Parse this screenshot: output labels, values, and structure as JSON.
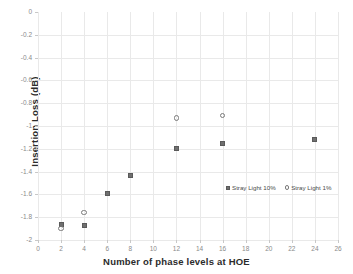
{
  "chart_data": {
    "type": "scatter",
    "title": "",
    "xlabel": "Number of phase levels at HOE",
    "ylabel": "Insertion Loss (dB)",
    "xlim": [
      0,
      26
    ],
    "ylim": [
      -2,
      0
    ],
    "xticks": [
      0,
      2,
      4,
      6,
      8,
      10,
      12,
      14,
      16,
      18,
      20,
      22,
      24,
      26
    ],
    "xtick_labels": [
      "0",
      "2",
      "4",
      "6",
      "8",
      "10",
      "12",
      "14",
      "16",
      "18",
      "20",
      "22",
      "24",
      "26"
    ],
    "yticks": [
      0,
      -0.2,
      -0.4,
      -0.6,
      -0.8,
      -1,
      -1.2,
      -1.4,
      -1.6,
      -1.8,
      -2
    ],
    "ytick_labels": [
      "0",
      "-0.2",
      "-0.4",
      "-0.6",
      "-0.8",
      "-1",
      "-1.2",
      "-1.4",
      "-1.6",
      "-1.8",
      "-2"
    ],
    "grid": true,
    "legend_position": "inside-lower-right",
    "series": [
      {
        "name": "Stray Light 10%",
        "marker": "filled-square",
        "color": "#6f6f6f",
        "points": [
          {
            "x": 2,
            "y": -1.86
          },
          {
            "x": 4,
            "y": -1.87
          },
          {
            "x": 6,
            "y": -1.59
          },
          {
            "x": 8,
            "y": -1.43
          },
          {
            "x": 12,
            "y": -1.2
          },
          {
            "x": 16,
            "y": -1.15
          },
          {
            "x": 24,
            "y": -1.12
          }
        ]
      },
      {
        "name": "Stray Light 1%",
        "marker": "open-circle",
        "color": "#7a7a7a",
        "points": [
          {
            "x": 2,
            "y": -1.9
          },
          {
            "x": 4,
            "y": -1.76
          },
          {
            "x": 12,
            "y": -0.93
          },
          {
            "x": 16,
            "y": -0.91
          }
        ]
      }
    ]
  },
  "legend": {
    "items": [
      {
        "label": "Stray Light 10%",
        "marker": "filled-square"
      },
      {
        "label": "Stray Light 1%",
        "marker": "open-circle"
      }
    ]
  }
}
